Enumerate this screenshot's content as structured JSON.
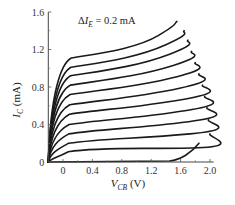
{
  "chart_data": {
    "type": "line",
    "title": "",
    "annotation": "ΔI_E = 0.2 mA",
    "annotation_parts": {
      "delta": "Δ",
      "var": "I",
      "sub": "E",
      "rest": " = 0.2 mA"
    },
    "xlabel": "V_CB (V)",
    "xlabel_parts": {
      "var": "V",
      "sub": "CB",
      "rest": " (V)"
    },
    "ylabel": "I_C (mA)",
    "ylabel_parts": {
      "var": "I",
      "sub": "C",
      "rest": " (mA)"
    },
    "xlim": [
      -0.2,
      2.05
    ],
    "ylim": [
      0,
      1.6
    ],
    "x_ticks": [
      "0",
      "0.4",
      "0.8",
      "1.2",
      "1.6",
      "2.0"
    ],
    "x_tick_values": [
      0,
      0.4,
      0.8,
      1.2,
      1.6,
      2.0
    ],
    "y_ticks": [
      "0",
      "0.4",
      "0.8",
      "1.2",
      "1.6"
    ],
    "y_tick_values": [
      0,
      0.4,
      0.8,
      1.2,
      1.6
    ],
    "grid": false,
    "legend": null,
    "series": [
      {
        "name": "curve-1",
        "plateau": 1.05,
        "end_x": 1.55,
        "end_y": 1.5
      },
      {
        "name": "curve-2",
        "plateau": 0.95,
        "end_x": 1.65,
        "end_y": 1.4
      },
      {
        "name": "curve-3",
        "plateau": 0.86,
        "end_x": 1.7,
        "end_y": 1.3
      },
      {
        "name": "curve-4",
        "plateau": 0.76,
        "end_x": 1.75,
        "end_y": 1.18
      },
      {
        "name": "curve-5",
        "plateau": 0.66,
        "end_x": 1.8,
        "end_y": 1.06
      },
      {
        "name": "curve-6",
        "plateau": 0.55,
        "end_x": 1.85,
        "end_y": 0.94
      },
      {
        "name": "curve-7",
        "plateau": 0.45,
        "end_x": 1.9,
        "end_y": 0.82
      },
      {
        "name": "curve-8",
        "plateau": 0.34,
        "end_x": 1.93,
        "end_y": 0.7
      },
      {
        "name": "curve-9",
        "plateau": 0.24,
        "end_x": 1.96,
        "end_y": 0.58
      },
      {
        "name": "curve-10",
        "plateau": 0.14,
        "end_x": 1.98,
        "end_y": 0.45
      },
      {
        "name": "curve-11",
        "plateau": 0.05,
        "end_x": 2.0,
        "end_y": 0.3
      },
      {
        "name": "curve-0",
        "plateau": 0.0,
        "end_x": 1.45,
        "end_y": 0.0
      }
    ]
  }
}
